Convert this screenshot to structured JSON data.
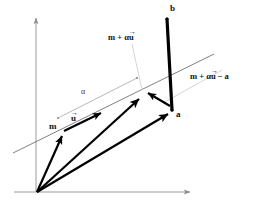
{
  "figure": {
    "background_color": "#ffffff",
    "axis_color": "#9a9a9a",
    "thin_line_color": "#6f6f6f",
    "leader_color": "#c9c9c9",
    "vector_color": "#000000",
    "label_color": "#111111",
    "width": 267,
    "height": 208
  },
  "labels": {
    "b": "b",
    "a": "a",
    "m": "m",
    "u_base": "u",
    "alpha": "α",
    "m_plus_alpha_u_prefix": "m + α",
    "m_plus_alpha_u_vec": "u",
    "m_plus_alpha_u_minus_a_prefix": "m + α",
    "m_plus_alpha_u_minus_a_vec": "u",
    "m_plus_alpha_u_minus_a_suffix": "− a",
    "vector_overbar": "→"
  },
  "geometry": {
    "origin": {
      "x": 37,
      "y": 192
    },
    "x_axis_end": {
      "x": 196,
      "y": 192
    },
    "y_axis_end": {
      "x": 36,
      "y": 15
    },
    "point_m": {
      "x": 63,
      "y": 132
    },
    "point_m_alpha_u": {
      "x": 143,
      "y": 93
    },
    "point_a": {
      "x": 172,
      "y": 110
    },
    "point_b": {
      "x": 168,
      "y": 17
    },
    "line_left": {
      "x": 14,
      "y": 152
    },
    "line_right": {
      "x": 213,
      "y": 55
    },
    "alpha_seg_start": {
      "x": 58,
      "y": 118
    },
    "alpha_seg_end": {
      "x": 136,
      "y": 78
    },
    "u_arrow_tip": {
      "x": 104,
      "y": 111
    }
  },
  "label_positions": {
    "b": {
      "x": 170,
      "y": 6
    },
    "a": {
      "x": 176,
      "y": 111
    },
    "m": {
      "x": 50,
      "y": 123
    },
    "u": {
      "x": 72,
      "y": 116
    },
    "alpha": {
      "x": 83,
      "y": 90
    },
    "m_plus_alpha_u": {
      "x": 108,
      "y": 34
    },
    "m_plus_alpha_u_minus_a": {
      "x": 191,
      "y": 73
    }
  }
}
